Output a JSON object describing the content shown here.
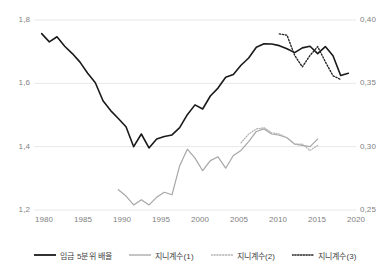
{
  "chart_data": {
    "type": "line",
    "title": "",
    "xlabel": "",
    "ylabel": "",
    "y2label": "",
    "grid": true,
    "grid_color": "#e8e8e8",
    "legend_position": "bottom",
    "x": [
      1980,
      1981,
      1982,
      1983,
      1984,
      1985,
      1986,
      1987,
      1988,
      1989,
      1990,
      1991,
      1992,
      1993,
      1994,
      1995,
      1996,
      1997,
      1998,
      1999,
      2000,
      2001,
      2002,
      2003,
      2004,
      2005,
      2006,
      2007,
      2008,
      2009,
      2010,
      2011,
      2012,
      2013,
      2014,
      2015,
      2016,
      2017,
      2018,
      2019,
      2020
    ],
    "xlim": [
      1979,
      2021
    ],
    "xticks": [
      "1980",
      "1985",
      "1990",
      "1995",
      "2000",
      "2005",
      "2010",
      "2015",
      "2020"
    ],
    "xtick_values": [
      1980,
      1985,
      1990,
      1995,
      2000,
      2005,
      2010,
      2015,
      2020
    ],
    "left_axis": {
      "ylim": [
        1.2,
        1.8
      ],
      "yticks": [
        "1,2",
        "1,4",
        "1,6",
        "1,8"
      ],
      "ytick_values": [
        1.2,
        1.4,
        1.6,
        1.8
      ]
    },
    "right_axis": {
      "ylim": [
        0.25,
        0.4
      ],
      "yticks": [
        "0,25",
        "0,30",
        "0,35",
        "0,40"
      ],
      "ytick_values": [
        0.25,
        0.3,
        0.35,
        0.4
      ]
    },
    "series": [
      {
        "name": "임금 5분위 배율",
        "axis": "left",
        "style": "solid",
        "color": "#1a1a1a",
        "width": 1.6,
        "x": [
          1980,
          1981,
          1982,
          1983,
          1984,
          1985,
          1986,
          1987,
          1988,
          1989,
          1990,
          1991,
          1992,
          1993,
          1994,
          1995,
          1996,
          1997,
          1998,
          1999,
          2000,
          2001,
          2002,
          2003,
          2004,
          2005,
          2006,
          2007,
          2008,
          2009,
          2010,
          2011,
          2012,
          2013,
          2014,
          2015,
          2016,
          2017,
          2018,
          2019,
          2020
        ],
        "values": [
          1.757,
          1.731,
          1.747,
          1.717,
          1.694,
          1.667,
          1.632,
          1.602,
          1.545,
          1.514,
          1.489,
          1.463,
          1.4,
          1.44,
          1.396,
          1.424,
          1.432,
          1.437,
          1.46,
          1.501,
          1.532,
          1.519,
          1.56,
          1.585,
          1.619,
          1.628,
          1.657,
          1.68,
          1.714,
          1.725,
          1.724,
          1.719,
          1.709,
          1.697,
          1.712,
          1.717,
          1.694,
          1.716,
          1.687,
          1.625,
          1.632
        ]
      },
      {
        "name": "지니계수(1)",
        "axis": "right",
        "style": "solid",
        "color": "#a6a6a6",
        "width": 1.2,
        "x": [
          1990,
          1991,
          1992,
          1993,
          1994,
          1995,
          1996,
          1997,
          1998,
          1999,
          2000,
          2001,
          2002,
          2003,
          2004,
          2005,
          2006,
          2007,
          2008,
          2009,
          2010,
          2011,
          2012,
          2013,
          2014,
          2015,
          2016
        ],
        "values": [
          0.266,
          0.261,
          0.254,
          0.258,
          0.254,
          0.26,
          0.264,
          0.262,
          0.285,
          0.298,
          0.291,
          0.281,
          0.289,
          0.292,
          0.283,
          0.293,
          0.297,
          0.304,
          0.312,
          0.314,
          0.31,
          0.309,
          0.307,
          0.302,
          0.301,
          0.3,
          0.306
        ]
      },
      {
        "name": "지니계수(2)",
        "axis": "right",
        "style": "dotted",
        "color": "#b3b3b3",
        "width": 1.2,
        "x": [
          2006,
          2007,
          2008,
          2009,
          2010,
          2011,
          2012,
          2013,
          2014,
          2015,
          2016
        ],
        "values": [
          0.303,
          0.31,
          0.314,
          0.315,
          0.311,
          0.31,
          0.307,
          0.302,
          0.302,
          0.297,
          0.301
        ]
      },
      {
        "name": "지니계수(3)",
        "axis": "right",
        "style": "dotted",
        "color": "#262626",
        "width": 1.4,
        "x": [
          2011,
          2012,
          2013,
          2014,
          2015,
          2016,
          2017,
          2018,
          2019
        ],
        "values": [
          0.389,
          0.388,
          0.372,
          0.363,
          0.372,
          0.379,
          0.367,
          0.356,
          0.353
        ]
      }
    ]
  },
  "axes": {
    "left_ticks": [
      "1,8",
      "1,6",
      "1,4",
      "1,2"
    ],
    "right_ticks": [
      "0,40",
      "0,35",
      "0,30",
      "0,25"
    ],
    "x_ticks": [
      "1980",
      "1985",
      "1990",
      "1995",
      "2000",
      "2005",
      "2010",
      "2015",
      "2020"
    ]
  },
  "legend": {
    "items": [
      {
        "label": "임금 5분위 배율",
        "swatch": "solid-black-line-icon"
      },
      {
        "label": "지니계수(1)",
        "swatch": "solid-gray-line-icon"
      },
      {
        "label": "지니계수(2)",
        "swatch": "dotted-lightgray-line-icon"
      },
      {
        "label": "지니계수(3)",
        "swatch": "dotted-black-line-icon"
      }
    ]
  },
  "colors": {
    "series_1": "#1a1a1a",
    "series_2": "#a6a6a6",
    "series_3": "#b3b3b3",
    "series_4": "#262626",
    "grid": "#e8e8e8",
    "axis_text": "#7f7f7f",
    "legend_text": "#3f3f3f",
    "background": "#ffffff"
  }
}
